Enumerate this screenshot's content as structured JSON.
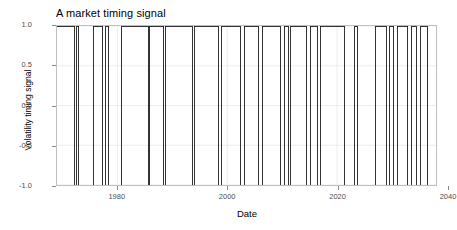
{
  "chart_data": {
    "type": "line",
    "title": "A market timing signal",
    "xlabel": "Date",
    "ylabel": "Volatility timing signal",
    "grid": true,
    "legend": "none",
    "xlim": [
      1969,
      2038
    ],
    "ylim": [
      -1.0,
      1.0
    ],
    "xticks": [
      1980,
      2000,
      2020,
      2040
    ],
    "xtick_labels": [
      "1980",
      "2000",
      "2020",
      "2040"
    ],
    "yticks": [
      1.0,
      0.5,
      0.0,
      -0.5,
      -1.0
    ],
    "ytick_labels": [
      "1.0",
      "0.5",
      "0.0",
      "-0.5",
      "-1.0"
    ],
    "series_name": "Volatility timing signal",
    "step_segments": [
      {
        "start": 1969.0,
        "end": 1972.2,
        "value": 1
      },
      {
        "start": 1972.2,
        "end": 1972.6,
        "value": -1
      },
      {
        "start": 1972.6,
        "end": 1973.0,
        "value": 1
      },
      {
        "start": 1973.0,
        "end": 1975.6,
        "value": -1
      },
      {
        "start": 1975.6,
        "end": 1977.3,
        "value": 1
      },
      {
        "start": 1977.3,
        "end": 1977.9,
        "value": -1
      },
      {
        "start": 1977.9,
        "end": 1978.4,
        "value": 1
      },
      {
        "start": 1978.4,
        "end": 1980.8,
        "value": -1
      },
      {
        "start": 1980.8,
        "end": 1985.6,
        "value": 1
      },
      {
        "start": 1985.6,
        "end": 1985.9,
        "value": -1
      },
      {
        "start": 1985.9,
        "end": 1988.4,
        "value": 1
      },
      {
        "start": 1988.4,
        "end": 1988.7,
        "value": -1
      },
      {
        "start": 1988.7,
        "end": 1993.6,
        "value": 1
      },
      {
        "start": 1993.6,
        "end": 1994.0,
        "value": -1
      },
      {
        "start": 1994.0,
        "end": 1998.4,
        "value": 1
      },
      {
        "start": 1998.4,
        "end": 1998.9,
        "value": -1
      },
      {
        "start": 1998.9,
        "end": 2002.4,
        "value": 1
      },
      {
        "start": 2002.4,
        "end": 2003.1,
        "value": -1
      },
      {
        "start": 2003.1,
        "end": 2005.6,
        "value": 1
      },
      {
        "start": 2005.6,
        "end": 2006.4,
        "value": -1
      },
      {
        "start": 2006.4,
        "end": 2009.6,
        "value": 1
      },
      {
        "start": 2009.6,
        "end": 2010.4,
        "value": -1
      },
      {
        "start": 2010.4,
        "end": 2011.1,
        "value": 1
      },
      {
        "start": 2011.1,
        "end": 2011.6,
        "value": -1
      },
      {
        "start": 2011.6,
        "end": 2014.4,
        "value": 1
      },
      {
        "start": 2014.4,
        "end": 2015.1,
        "value": -1
      },
      {
        "start": 2015.1,
        "end": 2016.4,
        "value": 1
      },
      {
        "start": 2016.4,
        "end": 2016.9,
        "value": -1
      },
      {
        "start": 2016.9,
        "end": 2021.4,
        "value": 1
      },
      {
        "start": 2021.4,
        "end": 2023.2,
        "value": -1
      },
      {
        "start": 2023.2,
        "end": 2023.7,
        "value": 1
      },
      {
        "start": 2023.7,
        "end": 2026.9,
        "value": -1
      },
      {
        "start": 2026.9,
        "end": 2028.9,
        "value": 1
      },
      {
        "start": 2028.9,
        "end": 2029.6,
        "value": -1
      },
      {
        "start": 2029.6,
        "end": 2030.2,
        "value": 1
      },
      {
        "start": 2030.2,
        "end": 2030.9,
        "value": -1
      },
      {
        "start": 2030.9,
        "end": 2032.9,
        "value": 1
      },
      {
        "start": 2032.9,
        "end": 2033.6,
        "value": -1
      },
      {
        "start": 2033.6,
        "end": 2034.4,
        "value": 1
      },
      {
        "start": 2034.4,
        "end": 2035.2,
        "value": -1
      },
      {
        "start": 2035.2,
        "end": 2036.4,
        "value": 1
      },
      {
        "start": 2036.4,
        "end": 2037.2,
        "value": -1
      }
    ]
  },
  "style": {
    "line_color": "#1a1a1a",
    "panel_background": "#ffffff",
    "panel_border": "#bfbfbf",
    "grid_color": "#e8e8e8",
    "tick_label_color": "#4d4d4d",
    "text_color": "#000000"
  }
}
